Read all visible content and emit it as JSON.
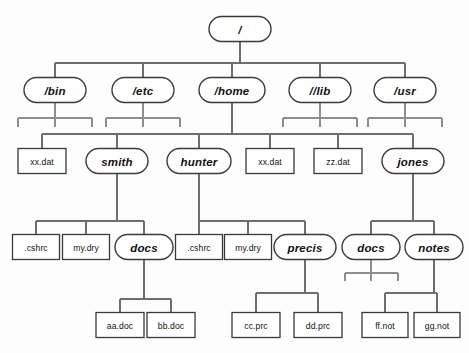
{
  "diagram": {
    "kind": "tree",
    "colors": {
      "background": "#fdfdfd",
      "node_stroke": "#3a3a3a",
      "node_fill": "#ffffff",
      "edge": "#6e6e6e",
      "stub": "#8d8d8d",
      "text": "#111111"
    },
    "legend": {
      "directory_shape": "rounded-rectangle-italic-bold",
      "file_shape": "rectangle-plain"
    }
  },
  "nodes": [
    {
      "id": "root",
      "label": "/",
      "type": "directory",
      "cx": 240,
      "cy": 29,
      "w": 62,
      "h": 25
    },
    {
      "id": "bin",
      "label": "/bin",
      "type": "directory",
      "cx": 55,
      "cy": 90,
      "w": 62,
      "h": 25
    },
    {
      "id": "etc",
      "label": "/etc",
      "type": "directory",
      "cx": 143,
      "cy": 90,
      "w": 62,
      "h": 25
    },
    {
      "id": "home",
      "label": "/home",
      "type": "directory",
      "cx": 232,
      "cy": 90,
      "w": 66,
      "h": 25
    },
    {
      "id": "lib",
      "label": "//lib",
      "type": "directory",
      "cx": 320,
      "cy": 90,
      "w": 62,
      "h": 25
    },
    {
      "id": "usr",
      "label": "/usr",
      "type": "directory",
      "cx": 405,
      "cy": 90,
      "w": 62,
      "h": 25
    },
    {
      "id": "xxdat1",
      "label": "xx.dat",
      "type": "file",
      "cx": 42,
      "cy": 161,
      "w": 48,
      "h": 25
    },
    {
      "id": "smith",
      "label": "smith",
      "type": "directory",
      "cx": 117,
      "cy": 161,
      "w": 62,
      "h": 25
    },
    {
      "id": "hunter",
      "label": "hunter",
      "type": "directory",
      "cx": 199,
      "cy": 161,
      "w": 64,
      "h": 25
    },
    {
      "id": "xxdat2",
      "label": "xx.dat",
      "type": "file",
      "cx": 270,
      "cy": 161,
      "w": 48,
      "h": 25
    },
    {
      "id": "zzdat",
      "label": "zz.dat",
      "type": "file",
      "cx": 338,
      "cy": 161,
      "w": 48,
      "h": 25
    },
    {
      "id": "jones",
      "label": "jones",
      "type": "directory",
      "cx": 413,
      "cy": 161,
      "w": 62,
      "h": 25
    },
    {
      "id": "cshrc1",
      "label": ".cshrc",
      "type": "file",
      "cx": 36,
      "cy": 247,
      "w": 47,
      "h": 25
    },
    {
      "id": "mydry1",
      "label": "my.dry",
      "type": "file",
      "cx": 86,
      "cy": 247,
      "w": 47,
      "h": 25
    },
    {
      "id": "docs1",
      "label": "docs",
      "type": "directory",
      "cx": 144,
      "cy": 247,
      "w": 58,
      "h": 25
    },
    {
      "id": "cshrc2",
      "label": ".cshrc",
      "type": "file",
      "cx": 199,
      "cy": 247,
      "w": 47,
      "h": 25
    },
    {
      "id": "mydry2",
      "label": "my.dry",
      "type": "file",
      "cx": 248,
      "cy": 247,
      "w": 47,
      "h": 25
    },
    {
      "id": "precis",
      "label": "precis",
      "type": "directory",
      "cx": 305,
      "cy": 247,
      "w": 62,
      "h": 25
    },
    {
      "id": "docs2",
      "label": "docs",
      "type": "directory",
      "cx": 371,
      "cy": 247,
      "w": 58,
      "h": 25
    },
    {
      "id": "notes",
      "label": "notes",
      "type": "directory",
      "cx": 434,
      "cy": 247,
      "w": 58,
      "h": 25
    },
    {
      "id": "aadoc",
      "label": "aa.doc",
      "type": "file",
      "cx": 120,
      "cy": 325,
      "w": 48,
      "h": 25
    },
    {
      "id": "bbdoc",
      "label": "bb.doc",
      "type": "file",
      "cx": 171,
      "cy": 325,
      "w": 48,
      "h": 25
    },
    {
      "id": "ccprc",
      "label": "cc.prc",
      "type": "file",
      "cx": 256,
      "cy": 325,
      "w": 48,
      "h": 25
    },
    {
      "id": "ddprc",
      "label": "dd.prc",
      "type": "file",
      "cx": 318,
      "cy": 325,
      "w": 48,
      "h": 25
    },
    {
      "id": "ffnot",
      "label": "ff.not",
      "type": "file",
      "cx": 385,
      "cy": 325,
      "w": 46,
      "h": 25
    },
    {
      "id": "ggnot",
      "label": "gg.not",
      "type": "file",
      "cx": 437,
      "cy": 325,
      "w": 46,
      "h": 25
    }
  ],
  "edges": [
    {
      "from": "root",
      "to": "bin"
    },
    {
      "from": "root",
      "to": "etc"
    },
    {
      "from": "root",
      "to": "home"
    },
    {
      "from": "root",
      "to": "lib"
    },
    {
      "from": "root",
      "to": "usr"
    },
    {
      "from": "home",
      "to": "xxdat1"
    },
    {
      "from": "home",
      "to": "smith"
    },
    {
      "from": "home",
      "to": "hunter"
    },
    {
      "from": "home",
      "to": "xxdat2"
    },
    {
      "from": "home",
      "to": "zzdat"
    },
    {
      "from": "home",
      "to": "jones"
    },
    {
      "from": "smith",
      "to": "cshrc1"
    },
    {
      "from": "smith",
      "to": "mydry1"
    },
    {
      "from": "smith",
      "to": "docs1"
    },
    {
      "from": "hunter",
      "to": "cshrc2"
    },
    {
      "from": "hunter",
      "to": "mydry2"
    },
    {
      "from": "hunter",
      "to": "precis"
    },
    {
      "from": "jones",
      "to": "docs2"
    },
    {
      "from": "jones",
      "to": "notes"
    },
    {
      "from": "docs1",
      "to": "aadoc"
    },
    {
      "from": "docs1",
      "to": "bbdoc"
    },
    {
      "from": "precis",
      "to": "ccprc"
    },
    {
      "from": "precis",
      "to": "ddprc"
    },
    {
      "from": "notes",
      "to": "ffnot"
    },
    {
      "from": "notes",
      "to": "ggnot"
    }
  ],
  "collapsed_parents": [
    {
      "parent": "bin",
      "stub_count": 3
    },
    {
      "parent": "etc",
      "stub_count": 3
    },
    {
      "parent": "lib",
      "stub_count": 3
    },
    {
      "parent": "usr",
      "stub_count": 3
    },
    {
      "parent": "docs2",
      "stub_count": 3
    }
  ]
}
